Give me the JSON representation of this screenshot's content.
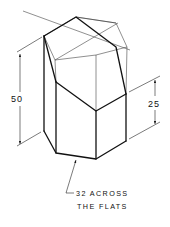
{
  "drawing": {
    "title": "Truncated hexagonal prism (isometric)",
    "dimensions": {
      "overall_height": "50",
      "cut_height": "25",
      "note_line1": "32 ACROSS",
      "note_line2": "THE FLATS"
    }
  }
}
